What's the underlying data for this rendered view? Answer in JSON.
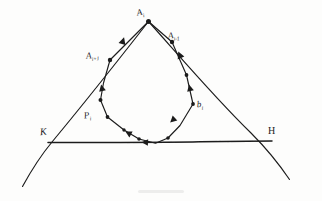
{
  "figure": {
    "type": "hand-drawn-geometry-diagram",
    "background_color": "#fdfdfc",
    "ink_color": "#1b1b1b",
    "width": 322,
    "height": 201,
    "labels": {
      "apex": {
        "base": "A",
        "sub": "i",
        "text": "Ai"
      },
      "prev_vertex": {
        "base": "A",
        "sub": "i-1",
        "text": "Ai-1"
      },
      "next_vertex": {
        "base": "A",
        "sub": "i+1",
        "text": "Ai+1"
      },
      "left_path_point": {
        "base": "P",
        "sub": "i",
        "text": "Pi"
      },
      "right_path_point": {
        "base": "b",
        "sub": "i",
        "text": "bi"
      },
      "left_line_end": {
        "base": "K",
        "sub": "",
        "text": "K"
      },
      "right_line_end": {
        "base": "H",
        "sub": "",
        "text": "H"
      }
    },
    "geometry": {
      "apex_point": [
        148,
        21
      ],
      "left_line": [
        [
          148,
          21
        ],
        [
          22,
          187
        ]
      ],
      "right_line": [
        [
          148,
          21
        ],
        [
          290,
          180
        ]
      ],
      "transversal_line": [
        [
          48,
          142
        ],
        [
          272,
          141
        ]
      ],
      "left_line_transversal_crossing": [
        52,
        142
      ],
      "right_line_transversal_crossing": [
        268,
        141
      ],
      "polygon_vertices": [
        [
          148,
          21
        ],
        [
          172,
          42
        ],
        [
          186,
          75
        ],
        [
          193,
          104
        ],
        [
          180,
          125
        ],
        [
          168,
          138
        ],
        [
          155,
          143
        ],
        [
          139,
          139
        ],
        [
          124,
          130
        ],
        [
          107,
          117
        ],
        [
          100,
          100
        ],
        [
          103,
          83
        ],
        [
          110,
          60
        ]
      ],
      "polygon_closed": true,
      "polygon_direction": "counter-clockwise-toward-apex",
      "marked_vertex_dots": [
        [
          148,
          21
        ],
        [
          172,
          42
        ],
        [
          186,
          75
        ],
        [
          193,
          104
        ],
        [
          168,
          138
        ],
        [
          139,
          139
        ],
        [
          124,
          130
        ],
        [
          107,
          117
        ],
        [
          100,
          100
        ],
        [
          110,
          60
        ]
      ],
      "arrowheads_on_polygon": [
        {
          "at": [
            179,
            55
          ],
          "angle": -245
        },
        {
          "at": [
            190,
            91
          ],
          "angle": -255
        },
        {
          "at": [
            175,
            117
          ],
          "angle": 140
        },
        {
          "at": [
            147,
            142
          ],
          "angle": 190
        },
        {
          "at": [
            131,
            135
          ],
          "angle": 205
        },
        {
          "at": [
            103,
            91
          ],
          "angle": 280
        },
        {
          "at": [
            122,
            44
          ],
          "angle": 300
        }
      ]
    }
  }
}
